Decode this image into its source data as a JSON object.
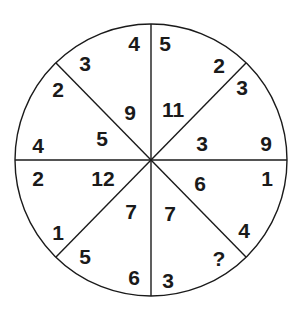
{
  "diagram": {
    "type": "circle-number-puzzle",
    "segments": 8,
    "colors": {
      "ink": "#1a1a1a",
      "background": "#ffffff"
    },
    "numbers": [
      {
        "id": "n1",
        "value": "4",
        "x": 134,
        "y": 43
      },
      {
        "id": "n2",
        "value": "3",
        "x": 85,
        "y": 63
      },
      {
        "id": "n3",
        "value": "2",
        "x": 58,
        "y": 89
      },
      {
        "id": "n4",
        "value": "9",
        "x": 130,
        "y": 112
      },
      {
        "id": "n5",
        "value": "5",
        "x": 102,
        "y": 138
      },
      {
        "id": "n6",
        "value": "4",
        "x": 38,
        "y": 145
      },
      {
        "id": "n7",
        "value": "5",
        "x": 165,
        "y": 43
      },
      {
        "id": "n8",
        "value": "2",
        "x": 219,
        "y": 65
      },
      {
        "id": "n9",
        "value": "3",
        "x": 242,
        "y": 87
      },
      {
        "id": "n10",
        "value": "11",
        "x": 173,
        "y": 109
      },
      {
        "id": "n11",
        "value": "3",
        "x": 202,
        "y": 143
      },
      {
        "id": "n12",
        "value": "9",
        "x": 266,
        "y": 143
      },
      {
        "id": "n13",
        "value": "2",
        "x": 38,
        "y": 178
      },
      {
        "id": "n14",
        "value": "12",
        "x": 103,
        "y": 178
      },
      {
        "id": "n15",
        "value": "7",
        "x": 131,
        "y": 211
      },
      {
        "id": "n16",
        "value": "1",
        "x": 58,
        "y": 232
      },
      {
        "id": "n17",
        "value": "5",
        "x": 85,
        "y": 256
      },
      {
        "id": "n18",
        "value": "6",
        "x": 134,
        "y": 277
      },
      {
        "id": "n19",
        "value": "6",
        "x": 200,
        "y": 183
      },
      {
        "id": "n20",
        "value": "1",
        "x": 267,
        "y": 178
      },
      {
        "id": "n21",
        "value": "7",
        "x": 170,
        "y": 213
      },
      {
        "id": "n22",
        "value": "4",
        "x": 244,
        "y": 230
      },
      {
        "id": "n23",
        "value": "?",
        "x": 219,
        "y": 258
      },
      {
        "id": "n24",
        "value": "3",
        "x": 168,
        "y": 280
      }
    ]
  }
}
